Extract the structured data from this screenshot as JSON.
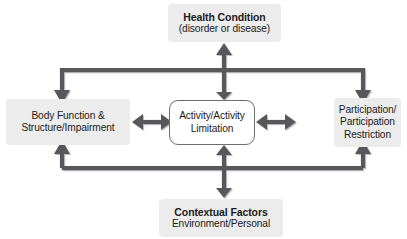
{
  "diagram": {
    "type": "flow-diagram",
    "background_color": "#ffffff",
    "connector_color": "#58595b",
    "node_fill_gray": "#ececec",
    "node_fill_center": "#ffffff",
    "node_border_center": "#6d6e70",
    "text_color": "#1b1b1b"
  },
  "nodes": {
    "health_condition": {
      "line1": "Health Condition",
      "line2": "(disorder or disease)",
      "position": "top",
      "style": "gray-box"
    },
    "body_function": {
      "line1": "Body Function &",
      "line2": "Structure/Impairment",
      "position": "left",
      "style": "gray-box"
    },
    "activity": {
      "line1": "Activity/Activity",
      "line2": "Limitation",
      "position": "center",
      "style": "outlined-rounded-box"
    },
    "participation": {
      "line1": "Participation/",
      "line2": "Participation",
      "line3": "Restriction",
      "position": "right",
      "style": "gray-box"
    },
    "contextual_factors": {
      "line1": "Contextual Factors",
      "line2": "Environment/Personal",
      "position": "bottom",
      "style": "gray-box"
    }
  },
  "connectors": [
    {
      "name": "health-to-activity",
      "from": "health_condition",
      "to": "activity",
      "direction": "bidirectional",
      "orientation": "vertical"
    },
    {
      "name": "health-bus-to-body",
      "from": "health_condition",
      "to": "body_function",
      "direction": "unidirectional",
      "orientation": "elbow"
    },
    {
      "name": "health-bus-to-participation",
      "from": "health_condition",
      "to": "participation",
      "direction": "unidirectional",
      "orientation": "elbow"
    },
    {
      "name": "body-to-activity",
      "from": "body_function",
      "to": "activity",
      "direction": "bidirectional",
      "orientation": "horizontal"
    },
    {
      "name": "activity-to-participation",
      "from": "activity",
      "to": "participation",
      "direction": "bidirectional",
      "orientation": "horizontal"
    },
    {
      "name": "contextual-to-activity",
      "from": "contextual_factors",
      "to": "activity",
      "direction": "bidirectional",
      "orientation": "vertical"
    },
    {
      "name": "contextual-bus-to-body",
      "from": "contextual_factors",
      "to": "body_function",
      "direction": "unidirectional",
      "orientation": "elbow"
    },
    {
      "name": "contextual-bus-to-participation",
      "from": "contextual_factors",
      "to": "participation",
      "direction": "unidirectional",
      "orientation": "elbow"
    }
  ]
}
